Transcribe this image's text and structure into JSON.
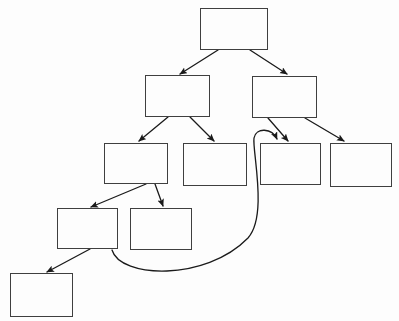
{
  "diagram": {
    "canvas": {
      "width": 399,
      "height": 321,
      "background": "#fdfdfd"
    },
    "style": {
      "box_stroke": "#3f3f3f",
      "box_fill": "none",
      "box_stroke_width": 1,
      "connector_stroke": "#1a1a1a",
      "connector_stroke_width": 1.3,
      "arrowhead": "filled-triangle"
    },
    "nodes": [
      {
        "id": "n1",
        "label": "",
        "x": 200,
        "y": 8,
        "w": 68,
        "h": 42,
        "level": 1
      },
      {
        "id": "n2",
        "label": "",
        "x": 145,
        "y": 75,
        "w": 65,
        "h": 42,
        "level": 2
      },
      {
        "id": "n3",
        "label": "",
        "x": 252,
        "y": 76,
        "w": 65,
        "h": 42,
        "level": 2
      },
      {
        "id": "n4",
        "label": "",
        "x": 104,
        "y": 143,
        "w": 64,
        "h": 41,
        "level": 3
      },
      {
        "id": "n5",
        "label": "",
        "x": 183,
        "y": 143,
        "w": 64,
        "h": 43,
        "level": 3
      },
      {
        "id": "n6",
        "label": "",
        "x": 260,
        "y": 143,
        "w": 61,
        "h": 42,
        "level": 3
      },
      {
        "id": "n7",
        "label": "",
        "x": 330,
        "y": 143,
        "w": 62,
        "h": 44,
        "level": 3
      },
      {
        "id": "n8",
        "label": "",
        "x": 57,
        "y": 208,
        "w": 61,
        "h": 41,
        "level": 4
      },
      {
        "id": "n9",
        "label": "",
        "x": 130,
        "y": 208,
        "w": 62,
        "h": 42,
        "level": 4
      },
      {
        "id": "n10",
        "label": "",
        "x": 10,
        "y": 273,
        "w": 63,
        "h": 44,
        "level": 5
      }
    ],
    "edges": [
      {
        "id": "e1",
        "from": "n1",
        "to": "n2",
        "kind": "straight",
        "path": "M 218 50 L 180 74"
      },
      {
        "id": "e2",
        "from": "n1",
        "to": "n3",
        "kind": "straight",
        "path": "M 250 50 L 287 74"
      },
      {
        "id": "e3",
        "from": "n2",
        "to": "n4",
        "kind": "straight",
        "path": "M 168 117 L 139 141"
      },
      {
        "id": "e4",
        "from": "n2",
        "to": "n5",
        "kind": "straight",
        "path": "M 190 117 L 214 141"
      },
      {
        "id": "e5",
        "from": "n3",
        "to": "n6",
        "kind": "straight",
        "path": "M 268 118 L 288 141"
      },
      {
        "id": "e6",
        "from": "n3",
        "to": "n7",
        "kind": "straight",
        "path": "M 305 118 L 344 141"
      },
      {
        "id": "e7",
        "from": "n4",
        "to": "n8",
        "kind": "straight",
        "path": "M 146 184 L 91 207"
      },
      {
        "id": "e8",
        "from": "n4",
        "to": "n9",
        "kind": "straight",
        "path": "M 155 184 L 163 206"
      },
      {
        "id": "e9",
        "from": "n8",
        "to": "n10",
        "kind": "straight",
        "path": "M 90 249 L 47 272"
      },
      {
        "id": "e10",
        "from": "n8",
        "to": "n6",
        "kind": "curved",
        "path": "M 112 250 C 120 278 205 282 248 238 C 268 216 252 150 254 138 C 256 127 272 128 277 139"
      }
    ]
  }
}
